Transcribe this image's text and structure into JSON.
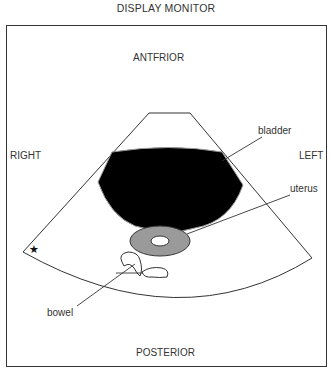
{
  "title": "DISPLAY MONITOR",
  "orientation": {
    "anterior": "ANTFRIOR",
    "posterior": "POSTERIOR",
    "right": "RIGHT",
    "left": "LEFT"
  },
  "structures": {
    "bladder": "bladder",
    "uterus": "uterus",
    "bowel": "bowel"
  },
  "marker": "★",
  "colors": {
    "bladder_fill": "#000000",
    "uterus_fill": "#9a9a9a",
    "line": "#333333",
    "frame": "#333333"
  }
}
